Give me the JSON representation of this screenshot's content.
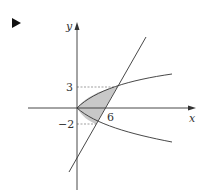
{
  "marker": {
    "icon": "play-triangle-icon"
  },
  "diagram": {
    "axes": {
      "x_label": "x",
      "y_label": "y"
    },
    "ticks": {
      "y_upper": "3",
      "y_lower": "−2",
      "x_tick": "6"
    },
    "curves": [
      {
        "name": "parabola",
        "description": "sideways parabola opening right, vertex at origin"
      },
      {
        "name": "line",
        "description": "line through (6,0) intersecting parabola at y=3 and y=-2"
      }
    ],
    "shaded_region": "area between parabola and line from y=-2 to y=3",
    "colors": {
      "stroke": "#333333",
      "fill": "#c8c8c8",
      "dashed": "#777777"
    }
  }
}
